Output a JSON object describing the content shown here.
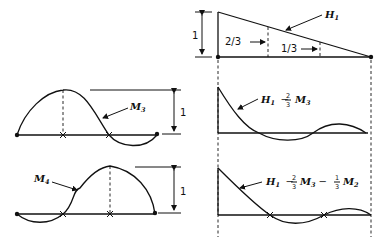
{
  "diagram": {
    "panels": {
      "H1": {
        "label": "H",
        "label_sub": "1",
        "height_label": "1",
        "ordinate_left": "2/3",
        "ordinate_right": "1/3"
      },
      "H1_minus_M3": {
        "label": "H",
        "label_sub": "1",
        "minus": "−",
        "frac_num": "2",
        "frac_den": "3",
        "term": "M",
        "term_sub": "3"
      },
      "H1_minus_M3_M2": {
        "label": "H",
        "label_sub": "1",
        "minus1": "−",
        "frac1_num": "2",
        "frac1_den": "3",
        "term1": "M",
        "term1_sub": "3",
        "minus2": "−",
        "frac2_num": "1",
        "frac2_den": "3",
        "term2": "M",
        "term2_sub": "2"
      },
      "M3": {
        "label": "M",
        "label_sub": "3",
        "height_label": "1"
      },
      "M4": {
        "label": "M",
        "label_sub": "4",
        "height_label": "1"
      }
    }
  }
}
